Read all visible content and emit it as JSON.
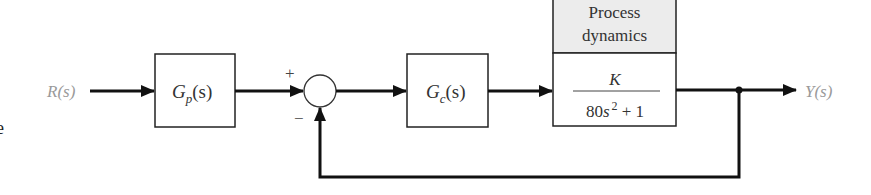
{
  "diagram": {
    "type": "feedback-control-block-diagram",
    "input_label": "R(s)",
    "output_label": "Y(s)",
    "summing_junction": {
      "plus_sign": "+",
      "minus_sign": "−"
    },
    "blocks": [
      {
        "id": "prefilter",
        "name": "G",
        "subscript": "p",
        "arg": "(s)"
      },
      {
        "id": "controller",
        "name": "G",
        "subscript": "c",
        "arg": "(s)"
      },
      {
        "id": "process",
        "header_line1": "Process",
        "header_line2": "dynamics",
        "numerator": "K",
        "denominator_coef": "80",
        "denominator_var": "s",
        "denominator_exp": "2",
        "denominator_rest": " + 1"
      }
    ],
    "edge_artifact": "e",
    "colors": {
      "line": "#111111",
      "signal_label": "#9a9a9a",
      "process_header_bg": "#ececec",
      "text": "#333333"
    }
  }
}
